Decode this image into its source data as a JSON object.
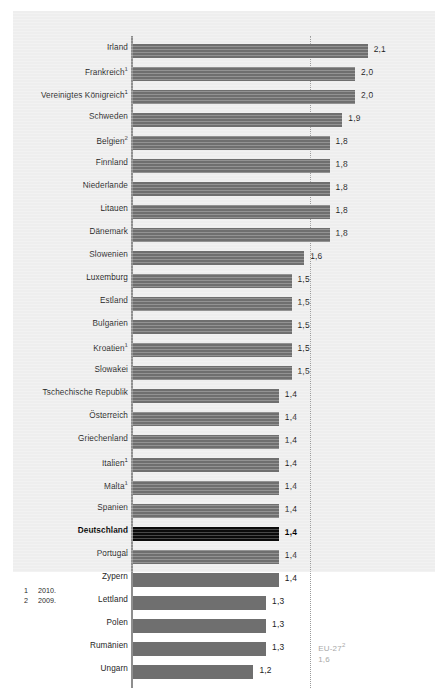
{
  "chart_data": {
    "type": "bar",
    "orientation": "horizontal",
    "title": "",
    "subtitle": "",
    "xlabel": "",
    "ylabel": "",
    "xlim": [
      0,
      2.35
    ],
    "grid": false,
    "legend": null,
    "value_format": "german-decimal-comma",
    "categories": [
      "Irland",
      "Frankreich",
      "Vereinigtes Königreich",
      "Schweden",
      "Belgien",
      "Finnland",
      "Niederlande",
      "Litauen",
      "Dänemark",
      "Slowenien",
      "Luxemburg",
      "Estland",
      "Bulgarien",
      "Kroatien",
      "Slowakei",
      "Tschechische Republik",
      "Österreich",
      "Griechenland",
      "Italien",
      "Malta",
      "Spanien",
      "Deutschland",
      "Portugal",
      "Zypern",
      "Lettland",
      "Polen",
      "Rumänien",
      "Ungarn"
    ],
    "values": [
      2.1,
      2.0,
      2.0,
      1.9,
      1.8,
      1.8,
      1.8,
      1.8,
      1.8,
      1.6,
      1.5,
      1.5,
      1.5,
      1.5,
      1.5,
      1.4,
      1.4,
      1.4,
      1.4,
      1.4,
      1.4,
      1.4,
      1.4,
      1.4,
      1.3,
      1.3,
      1.3,
      1.2
    ],
    "bars": [
      {
        "label": "Irland",
        "footnote": "",
        "value": 2.1,
        "value_label": "2,1",
        "highlight": false
      },
      {
        "label": "Frankreich",
        "footnote": "1",
        "value": 2.0,
        "value_label": "2,0",
        "highlight": false
      },
      {
        "label": "Vereinigtes Königreich",
        "footnote": "1",
        "value": 2.0,
        "value_label": "2,0",
        "highlight": false
      },
      {
        "label": "Schweden",
        "footnote": "",
        "value": 1.9,
        "value_label": "1,9",
        "highlight": false
      },
      {
        "label": "Belgien",
        "footnote": "2",
        "value": 1.8,
        "value_label": "1,8",
        "highlight": false
      },
      {
        "label": "Finnland",
        "footnote": "",
        "value": 1.8,
        "value_label": "1,8",
        "highlight": false
      },
      {
        "label": "Niederlande",
        "footnote": "",
        "value": 1.8,
        "value_label": "1,8",
        "highlight": false
      },
      {
        "label": "Litauen",
        "footnote": "",
        "value": 1.8,
        "value_label": "1,8",
        "highlight": false
      },
      {
        "label": "Dänemark",
        "footnote": "",
        "value": 1.8,
        "value_label": "1,8",
        "highlight": false
      },
      {
        "label": "Slowenien",
        "footnote": "",
        "value": 1.6,
        "value_label": "1,6",
        "highlight": false
      },
      {
        "label": "Luxemburg",
        "footnote": "",
        "value": 1.5,
        "value_label": "1,5",
        "highlight": false
      },
      {
        "label": "Estland",
        "footnote": "",
        "value": 1.5,
        "value_label": "1,5",
        "highlight": false
      },
      {
        "label": "Bulgarien",
        "footnote": "",
        "value": 1.5,
        "value_label": "1,5",
        "highlight": false
      },
      {
        "label": "Kroatien",
        "footnote": "1",
        "value": 1.5,
        "value_label": "1,5",
        "highlight": false
      },
      {
        "label": "Slowakei",
        "footnote": "",
        "value": 1.5,
        "value_label": "1,5",
        "highlight": false
      },
      {
        "label": "Tschechische Republik",
        "footnote": "",
        "value": 1.4,
        "value_label": "1,4",
        "highlight": false
      },
      {
        "label": "Österreich",
        "footnote": "",
        "value": 1.4,
        "value_label": "1,4",
        "highlight": false
      },
      {
        "label": "Griechenland",
        "footnote": "",
        "value": 1.4,
        "value_label": "1,4",
        "highlight": false
      },
      {
        "label": "Italien",
        "footnote": "1",
        "value": 1.4,
        "value_label": "1,4",
        "highlight": false
      },
      {
        "label": "Malta",
        "footnote": "1",
        "value": 1.4,
        "value_label": "1,4",
        "highlight": false
      },
      {
        "label": "Spanien",
        "footnote": "",
        "value": 1.4,
        "value_label": "1,4",
        "highlight": false
      },
      {
        "label": "Deutschland",
        "footnote": "",
        "value": 1.4,
        "value_label": "1,4",
        "highlight": true
      },
      {
        "label": "Portugal",
        "footnote": "",
        "value": 1.4,
        "value_label": "1,4",
        "highlight": false
      },
      {
        "label": "Zypern",
        "footnote": "",
        "value": 1.4,
        "value_label": "1,4",
        "highlight": false
      },
      {
        "label": "Lettland",
        "footnote": "",
        "value": 1.3,
        "value_label": "1,3",
        "highlight": false
      },
      {
        "label": "Polen",
        "footnote": "",
        "value": 1.3,
        "value_label": "1,3",
        "highlight": false
      },
      {
        "label": "Rumänien",
        "footnote": "",
        "value": 1.3,
        "value_label": "1,3",
        "highlight": false
      },
      {
        "label": "Ungarn",
        "footnote": "",
        "value": 1.2,
        "value_label": "1,2",
        "highlight": false
      }
    ],
    "reference_line": {
      "label": "EU-27",
      "footnote": "2",
      "value": 1.6,
      "value_label": "1,6",
      "style": "dotted"
    },
    "colors": {
      "bar": "#6f6f6f",
      "bar_highlight": "#0b0b0b",
      "panel_background": "#eeeeee",
      "axis": "#8e8e8e",
      "reference_line": "#9a9a9a",
      "reference_label": "#a8a8a8",
      "text": "#262626"
    }
  },
  "footnotes": [
    {
      "marker": "1",
      "text": "2010."
    },
    {
      "marker": "2",
      "text": "2009."
    }
  ]
}
